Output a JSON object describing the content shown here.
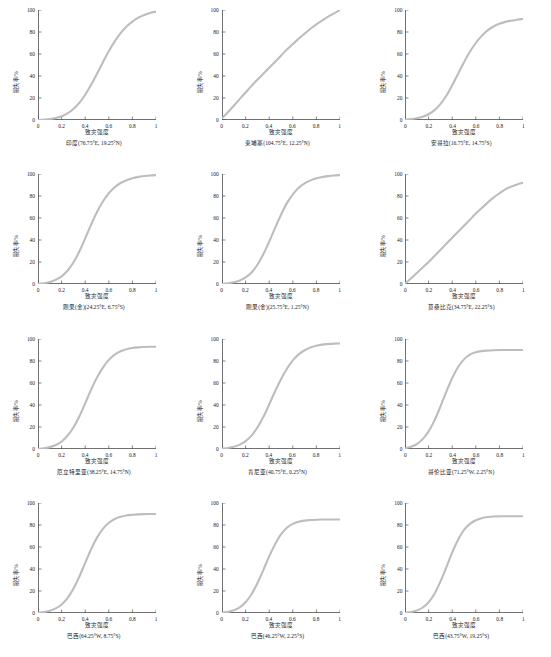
{
  "figure": {
    "type": "small-multiples",
    "rows": 4,
    "cols": 3,
    "curve_color": "#bdbdbd",
    "axis_color": "#333333",
    "background": "#ffffff"
  },
  "axes": {
    "xlabel": "致灾强度",
    "ylabel": "损失率/%",
    "xticks": [
      "0",
      "0.2",
      "0.4",
      "0.6",
      "0.8",
      "1"
    ],
    "yticks": [
      "0",
      "20",
      "40",
      "60",
      "80",
      "100"
    ],
    "xlim": [
      0,
      1
    ],
    "ylim": [
      0,
      100
    ]
  },
  "chart_data": {
    "type": "line",
    "title": "",
    "xlabel": "致灾强度",
    "ylabel": "损失率/%",
    "xlim": [
      0,
      1
    ],
    "ylim": [
      0,
      100
    ],
    "grid": false,
    "legend": "none",
    "x": [
      0,
      0.05,
      0.1,
      0.15,
      0.2,
      0.25,
      0.3,
      0.35,
      0.4,
      0.45,
      0.5,
      0.55,
      0.6,
      0.65,
      0.7,
      0.75,
      0.8,
      0.85,
      0.9,
      0.95,
      1
    ],
    "series": [
      {
        "name": "印度(76.75°E, 19.25°N)",
        "panel": 1,
        "model": "logistic",
        "midpoint": 0.57,
        "plateau": 99,
        "values": [
          0,
          0.3,
          0.8,
          1.8,
          3.4,
          6.0,
          10.0,
          15.5,
          23.0,
          32.0,
          42.0,
          52.5,
          62.5,
          71.5,
          79.0,
          85.0,
          89.5,
          93.0,
          95.5,
          97.3,
          98.5
        ]
      },
      {
        "name": "柬埔寨(104.75°E, 12.25°N)",
        "panel": 2,
        "model": "concave",
        "midpoint": null,
        "plateau": 100,
        "values": [
          1.5,
          7.0,
          13.0,
          19.0,
          25.0,
          31.0,
          36.5,
          42.0,
          47.5,
          53.0,
          58.5,
          64.0,
          69.0,
          74.0,
          78.5,
          83.0,
          87.0,
          90.5,
          94.0,
          97.0,
          100.0
        ]
      },
      {
        "name": "安哥拉(16.75°E, 14.75°S)",
        "panel": 3,
        "model": "logistic",
        "midpoint": 0.47,
        "plateau": 92,
        "values": [
          0.3,
          0.8,
          1.6,
          3.0,
          5.2,
          9.0,
          14.5,
          22.0,
          31.5,
          42.0,
          52.5,
          62.0,
          70.0,
          76.5,
          81.5,
          85.0,
          87.5,
          89.2,
          90.3,
          91.2,
          91.8
        ]
      },
      {
        "name": "刚果(金)(24.25°E, 6.75°S)",
        "panel": 4,
        "model": "logistic",
        "midpoint": 0.45,
        "plateau": 99,
        "values": [
          0.2,
          0.7,
          1.8,
          3.8,
          7.0,
          12.0,
          19.5,
          29.5,
          41.5,
          54.0,
          65.5,
          75.0,
          82.5,
          88.0,
          91.8,
          94.4,
          96.2,
          97.4,
          98.2,
          98.7,
          99.0
        ]
      },
      {
        "name": "刚果(金)(25.75°E, 1.25°N)",
        "panel": 5,
        "model": "logistic",
        "midpoint": 0.46,
        "plateau": 99,
        "values": [
          0.2,
          0.6,
          1.5,
          3.2,
          6.0,
          10.5,
          17.5,
          27.0,
          38.5,
          51.0,
          63.0,
          73.5,
          81.5,
          87.5,
          91.5,
          94.2,
          96.1,
          97.3,
          98.1,
          98.7,
          99.0
        ]
      },
      {
        "name": "莫桑比克(34.75°E, 22.25°S)",
        "panel": 6,
        "model": "concave",
        "midpoint": null,
        "plateau": 92,
        "values": [
          0.5,
          5.0,
          10.0,
          15.0,
          20.0,
          25.5,
          31.0,
          36.5,
          42.0,
          47.5,
          53.0,
          58.5,
          64.0,
          69.0,
          74.0,
          78.5,
          82.5,
          86.0,
          88.5,
          90.5,
          92.0
        ]
      },
      {
        "name": "厄立特里亚(38.25°E, 14.75°N)",
        "panel": 7,
        "model": "logistic",
        "midpoint": 0.44,
        "plateau": 93,
        "values": [
          0.2,
          0.7,
          1.7,
          3.6,
          6.8,
          12.0,
          19.5,
          29.5,
          41.5,
          54.0,
          65.0,
          74.0,
          81.0,
          85.8,
          88.8,
          90.7,
          91.8,
          92.4,
          92.7,
          92.9,
          93.0
        ]
      },
      {
        "name": "肯尼亚(40.75°E, 0.25°N)",
        "panel": 8,
        "model": "logistic",
        "midpoint": 0.45,
        "plateau": 96,
        "values": [
          0.3,
          0.9,
          2.0,
          4.0,
          7.2,
          12.2,
          19.5,
          29.0,
          40.5,
          52.5,
          63.5,
          73.0,
          80.5,
          86.0,
          89.8,
          92.3,
          93.9,
          94.9,
          95.4,
          95.8,
          96.0
        ]
      },
      {
        "name": "哥伦比亚(71.25°W, 2.25°N)",
        "panel": 9,
        "model": "logistic",
        "midpoint": 0.34,
        "plateau": 90,
        "values": [
          0.5,
          2.0,
          4.5,
          9.0,
          16.0,
          26.0,
          38.5,
          52.0,
          64.5,
          74.5,
          81.5,
          85.8,
          88.0,
          89.0,
          89.5,
          89.8,
          90.0,
          90.0,
          90.0,
          90.0,
          90.0
        ]
      },
      {
        "name": "巴西(64.25°W, 8.75°S)",
        "panel": 10,
        "model": "logistic",
        "midpoint": 0.42,
        "plateau": 90,
        "values": [
          0.2,
          0.8,
          2.0,
          4.2,
          7.8,
          13.5,
          22.0,
          33.0,
          45.5,
          58.0,
          68.5,
          76.5,
          82.0,
          85.5,
          87.5,
          88.7,
          89.3,
          89.7,
          89.9,
          90.0,
          90.0
        ]
      },
      {
        "name": "巴西(46.25°W, 2.25°S)",
        "panel": 11,
        "model": "logistic",
        "midpoint": 0.4,
        "plateau": 85,
        "values": [
          0.2,
          1.0,
          2.5,
          5.2,
          9.8,
          17.0,
          27.0,
          39.0,
          51.5,
          62.5,
          71.5,
          77.5,
          81.0,
          83.0,
          84.0,
          84.5,
          84.8,
          85.0,
          85.0,
          85.0,
          85.0
        ]
      },
      {
        "name": "巴西(43.75°W, 19.25°S)",
        "panel": 12,
        "model": "logistic",
        "midpoint": 0.39,
        "plateau": 88,
        "values": [
          0.2,
          0.9,
          2.3,
          5.0,
          9.8,
          17.5,
          28.5,
          41.5,
          55.0,
          66.5,
          75.5,
          81.0,
          84.3,
          86.2,
          87.2,
          87.7,
          87.9,
          88.0,
          88.0,
          88.0,
          88.0
        ]
      }
    ]
  }
}
